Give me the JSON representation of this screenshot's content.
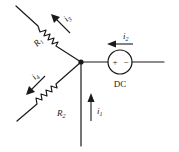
{
  "diagram": {
    "type": "circuit",
    "node": "junction",
    "branches": [
      {
        "id": "R1",
        "component": "resistor",
        "label": "R",
        "subscript": "1",
        "current": {
          "label": "i",
          "subscript": "3",
          "direction": "away-from-junction"
        }
      },
      {
        "id": "R2",
        "component": "resistor",
        "label": "R",
        "subscript": "2",
        "current": {
          "label": "i",
          "subscript": "4",
          "direction": "away-from-junction"
        }
      },
      {
        "id": "DC",
        "component": "dc-voltage-source",
        "label": "DC",
        "plus": "+",
        "minus": "−",
        "current": {
          "label": "i",
          "subscript": "2",
          "direction": "into-junction"
        }
      },
      {
        "id": "wire-bottom",
        "component": "wire",
        "current": {
          "label": "i",
          "subscript": "1",
          "direction": "into-junction"
        }
      }
    ]
  },
  "labels": {
    "r1": {
      "main": "R",
      "sub": "1"
    },
    "r2": {
      "main": "R",
      "sub": "2"
    },
    "i1": {
      "main": "i",
      "sub": "1"
    },
    "i2": {
      "main": "i",
      "sub": "2"
    },
    "i3": {
      "main": "i",
      "sub": "3"
    },
    "i4": {
      "main": "i",
      "sub": "4"
    },
    "dc": "DC",
    "plus": "+",
    "minus": "−"
  }
}
